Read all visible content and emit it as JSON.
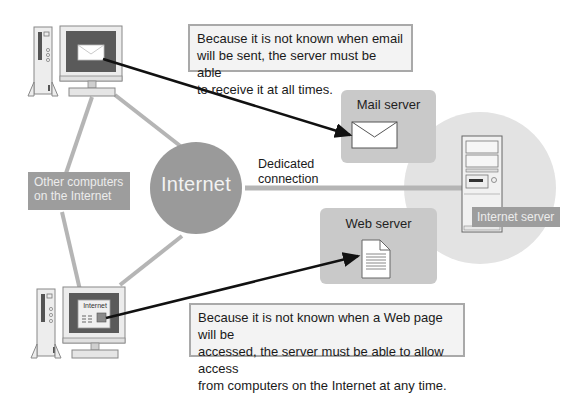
{
  "diagram": {
    "nodes": {
      "internet": {
        "label": "Internet"
      },
      "other_computers": {
        "label_line1": "Other computers",
        "label_line2": "on the Internet"
      },
      "mail_server": {
        "label": "Mail server",
        "icon": "envelope-icon"
      },
      "web_server": {
        "label": "Web server",
        "icon": "document-icon"
      },
      "internet_server": {
        "label": "Internet server",
        "icon": "tower-server-icon"
      },
      "client_top": {
        "icon": "desktop-computer-icon",
        "screen_icon": "envelope-icon"
      },
      "client_bottom": {
        "icon": "desktop-computer-icon",
        "screen_label": "Internet"
      }
    },
    "edges": {
      "dedicated_connection": {
        "label_line1": "Dedicated",
        "label_line2": "connection"
      }
    },
    "notes": {
      "email": {
        "line1": "Because it is not known when email",
        "line2": "will be sent, the server must be able",
        "line3": "to receive it at all times."
      },
      "web": {
        "line1": "Because it is not known when a Web page will be",
        "line2": "accessed, the server must be able to allow access",
        "line3": "from computers on the Internet at any time."
      }
    },
    "colors": {
      "internet_circle": "#9a9a9a",
      "server_halo": "#e3e3e3",
      "server_box": "#c9c9c9",
      "connector": "#b8b8b8",
      "arrow": "#111111",
      "label_box": "#9d9d9d"
    }
  }
}
